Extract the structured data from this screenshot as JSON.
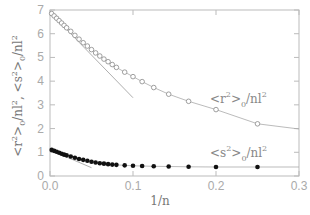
{
  "chart_data": {
    "type": "scatter",
    "title": "",
    "xlabel": "1/n",
    "ylabel": "<r^2>_0/nl^2 , <s^2>_0/nl^2",
    "xlim": [
      0.0,
      0.3
    ],
    "ylim": [
      0,
      7
    ],
    "xticks": [
      "0.0",
      "0.1",
      "0.2",
      "0.3"
    ],
    "yticks": [
      "0",
      "1",
      "2",
      "3",
      "4",
      "5",
      "6",
      "7"
    ],
    "grid": false,
    "legend": "inline annotations",
    "series": [
      {
        "name": "<r^2>_0/nl^2",
        "marker": "open-circle",
        "x": [
          0.002,
          0.005,
          0.008,
          0.011,
          0.014,
          0.017,
          0.02,
          0.025,
          0.03,
          0.035,
          0.04,
          0.045,
          0.05,
          0.055,
          0.06,
          0.065,
          0.07,
          0.075,
          0.08,
          0.09,
          0.1,
          0.111,
          0.125,
          0.143,
          0.167,
          0.2,
          0.25
        ],
        "y": [
          6.85,
          6.75,
          6.65,
          6.55,
          6.45,
          6.35,
          6.25,
          6.1,
          5.93,
          5.77,
          5.62,
          5.48,
          5.33,
          5.19,
          5.06,
          4.93,
          4.82,
          4.7,
          4.58,
          4.38,
          4.19,
          3.98,
          3.73,
          3.45,
          3.15,
          2.8,
          2.2
        ],
        "fit_curve_end": [
          0.3,
          1.98
        ]
      },
      {
        "name": "<s^2>_0/nl^2",
        "marker": "filled-circle",
        "x": [
          0.002,
          0.005,
          0.008,
          0.011,
          0.014,
          0.017,
          0.02,
          0.025,
          0.03,
          0.035,
          0.04,
          0.045,
          0.05,
          0.055,
          0.06,
          0.065,
          0.07,
          0.075,
          0.08,
          0.09,
          0.1,
          0.111,
          0.125,
          0.143,
          0.167,
          0.2,
          0.25
        ],
        "y": [
          1.1,
          1.06,
          1.02,
          0.98,
          0.94,
          0.9,
          0.87,
          0.82,
          0.77,
          0.72,
          0.68,
          0.64,
          0.6,
          0.57,
          0.54,
          0.52,
          0.5,
          0.48,
          0.47,
          0.45,
          0.43,
          0.42,
          0.41,
          0.4,
          0.39,
          0.38,
          0.38
        ],
        "fit_curve_end": [
          0.3,
          0.38
        ]
      }
    ],
    "tangent_lines": [
      {
        "series": "<r^2>_0/nl^2",
        "from": [
          0.0,
          6.9
        ],
        "to": [
          0.1,
          3.3
        ]
      },
      {
        "series": "<s^2>_0/nl^2",
        "from": [
          0.0,
          1.1
        ],
        "to": [
          0.05,
          0.35
        ]
      }
    ],
    "annotations": [
      {
        "text": "<r^2>_0/nl^2",
        "x": 0.19,
        "y": 3.3
      },
      {
        "text": "<s^2>_0/nl^2",
        "x": 0.2,
        "y": 0.75
      }
    ]
  },
  "labels": {
    "xlabel": "1/n",
    "ylabel_r": "<r",
    "ylabel_s": "<s",
    "ann_r_main": "<r",
    "ann_s_main": "<s",
    "sup2": "2",
    "sub0": "0",
    "nl": "/nl",
    "sep": ",",
    "close": ">"
  }
}
